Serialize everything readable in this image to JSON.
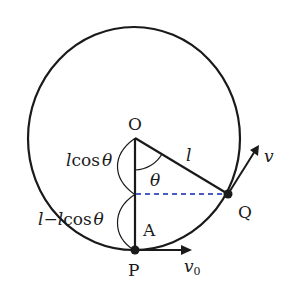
{
  "diagram": {
    "type": "pendulum-circular-motion",
    "colors": {
      "stroke": "#1a1a1a",
      "dashed_line": "#4a5bc4",
      "background": "#ffffff"
    },
    "angle_theta_deg": 59,
    "points": {
      "O": "O",
      "P": "P",
      "Q": "Q",
      "A": "A"
    },
    "labels": {
      "string_length": "l",
      "theta": "θ",
      "upper_segment": "lcosθ",
      "upper_segment_l": "l",
      "upper_segment_cos": "cos",
      "upper_segment_theta": "θ",
      "lower_segment_l1": "l",
      "lower_segment_minus": "−",
      "lower_segment_l2": "l",
      "lower_segment_cos": "cos",
      "lower_segment_theta": "θ",
      "velocity_q": "v",
      "velocity_p": "v",
      "velocity_p_sub": "0"
    }
  }
}
